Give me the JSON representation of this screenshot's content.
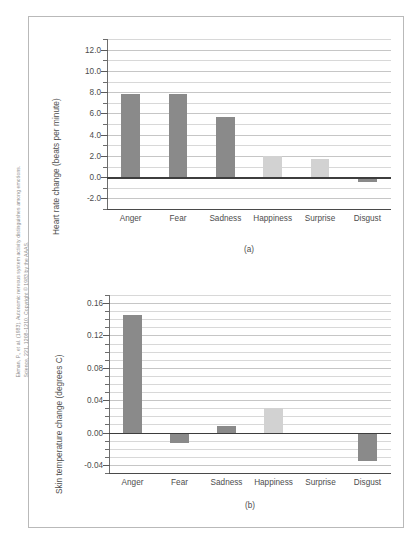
{
  "source_citation": "Ekman, P., et al. (1983). Autonomic nervous system activity distinguishes among emotions.\nScience, 221, 1208–1210. Copyright © 1983 by the AAAS.",
  "colors": {
    "bar_dark": "#8a8a8a",
    "bar_light": "#d2d2d2",
    "gridline": "#c6c6c6",
    "axis": "#4a4a4a",
    "frame": "#b9b9b9",
    "text": "#4d4d4d"
  },
  "chart_data": [
    {
      "type": "bar",
      "panel_label": "(a)",
      "title": "",
      "xlabel": "",
      "ylabel": "Heart rate change (beats per minute)",
      "categories": [
        "Anger",
        "Fear",
        "Sadness",
        "Happiness",
        "Surprise",
        "Disgust"
      ],
      "values": [
        7.8,
        7.8,
        5.7,
        1.95,
        1.75,
        -0.5
      ],
      "bar_colors": [
        "#8a8a8a",
        "#8a8a8a",
        "#8a8a8a",
        "#d2d2d2",
        "#d2d2d2",
        "#8a8a8a"
      ],
      "ylim": [
        -3.0,
        13.0
      ],
      "yticks": [
        12.0,
        10.0,
        8.0,
        6.0,
        4.0,
        2.0,
        0.0,
        -2.0
      ],
      "ytick_labels": [
        "12.0",
        "10.0",
        "8.0",
        "6.0",
        "4.0",
        "2.0",
        "0.0",
        "-2.0"
      ],
      "minor_gridline_step": 1.0,
      "grid": true,
      "legend": "none"
    },
    {
      "type": "bar",
      "panel_label": "(b)",
      "title": "",
      "xlabel": "",
      "ylabel": "Skin temperature change (degrees C)",
      "categories": [
        "Anger",
        "Fear",
        "Sadness",
        "Happiness",
        "Surprise",
        "Disgust"
      ],
      "values": [
        0.145,
        -0.013,
        0.008,
        0.03,
        -0.002,
        -0.035
      ],
      "bar_colors": [
        "#8a8a8a",
        "#8a8a8a",
        "#8a8a8a",
        "#d2d2d2",
        "#d2d2d2",
        "#8a8a8a"
      ],
      "ylim": [
        -0.05,
        0.17
      ],
      "yticks": [
        0.16,
        0.12,
        0.08,
        0.04,
        0.0,
        -0.04
      ],
      "ytick_labels": [
        "0.16",
        "0.12",
        "0.08",
        "0.04",
        "0.00",
        "-0.04"
      ],
      "minor_gridline_step": 0.01,
      "grid": true,
      "legend": "none"
    }
  ]
}
